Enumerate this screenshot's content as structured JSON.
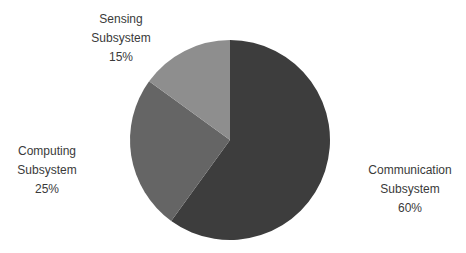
{
  "chart_data": {
    "type": "pie",
    "title": "",
    "categories": [
      "Communication Subsystem",
      "Computing Subsystem",
      "Sensing Subsystem"
    ],
    "values": [
      60,
      25,
      15
    ],
    "unit": "%",
    "colors": [
      "#3d3d3d",
      "#656565",
      "#8e8e8e"
    ],
    "start_angle_deg": 0,
    "direction": "clockwise",
    "legend": "none",
    "labels_outside": true,
    "background_color": "#ffffff",
    "label_text_color": "#3a3a3a"
  },
  "callouts": {
    "sensing": "Sensing\nSubsystem\n15%",
    "computing": "Computing\nSubsystem\n25%",
    "communication": "Communication\nSubsystem\n60%"
  }
}
